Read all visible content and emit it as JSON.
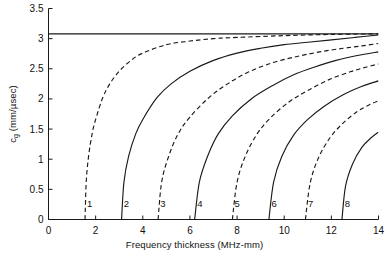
{
  "chart_data": {
    "type": "line",
    "title": "",
    "xlabel": "Frequency thickness (MHz-mm)",
    "ylabel_main": "c",
    "ylabel_sub": "g",
    "ylabel_units": " (mm/µsec)",
    "xlim": [
      0,
      14
    ],
    "ylim": [
      0,
      3.5
    ],
    "xticks": [
      0,
      2,
      4,
      6,
      8,
      10,
      12,
      14
    ],
    "xticklabels": [
      "0",
      "2",
      "4",
      "6",
      "8",
      "10",
      "12",
      "14"
    ],
    "yticks": [
      0,
      0.5,
      1,
      1.5,
      2,
      2.5,
      3,
      3.5
    ],
    "yticklabels": [
      "0",
      "0.5",
      "1",
      "1.5",
      "2",
      "2.5",
      "3",
      "3.5"
    ],
    "grid": false,
    "legend": "none",
    "line_color": "#1a1a1a",
    "series": [
      {
        "name": "asymptote",
        "label": "",
        "style": "solid",
        "cutoff": 0,
        "asymptote": 3.08,
        "x": [
          0,
          1,
          2,
          3,
          4,
          5,
          6,
          7,
          8,
          9,
          10,
          11,
          12,
          13,
          14
        ],
        "values": [
          3.08,
          3.08,
          3.08,
          3.08,
          3.08,
          3.08,
          3.08,
          3.08,
          3.08,
          3.08,
          3.08,
          3.08,
          3.08,
          3.08,
          3.08
        ]
      },
      {
        "name": "mode-1",
        "label": "1",
        "style": "dashed",
        "cutoff": 1.55,
        "asymptote": 3.08,
        "x": [
          1.55,
          1.6,
          1.7,
          1.85,
          2.0,
          2.3,
          2.6,
          3.0,
          3.5,
          4.0,
          5.0,
          6.0,
          7.0,
          8.0,
          10.0,
          12.0,
          14.0
        ],
        "values": [
          0.0,
          0.62,
          1.05,
          1.42,
          1.66,
          2.02,
          2.25,
          2.46,
          2.64,
          2.76,
          2.9,
          2.96,
          3.0,
          3.02,
          3.05,
          3.07,
          3.08
        ]
      },
      {
        "name": "mode-2",
        "label": "2",
        "style": "solid",
        "cutoff": 3.1,
        "asymptote": 3.06,
        "x": [
          3.1,
          3.2,
          3.4,
          3.7,
          4.0,
          4.6,
          5.2,
          6.0,
          7.0,
          8.0,
          9.0,
          10.0,
          11.0,
          12.0,
          13.0,
          14.0
        ],
        "values": [
          0.0,
          0.62,
          1.05,
          1.42,
          1.66,
          2.02,
          2.25,
          2.46,
          2.64,
          2.76,
          2.84,
          2.9,
          2.94,
          2.98,
          3.02,
          3.06
        ]
      },
      {
        "name": "mode-3",
        "label": "3",
        "style": "dashed",
        "cutoff": 4.65,
        "asymptote": 2.92,
        "x": [
          4.65,
          4.8,
          5.1,
          5.5,
          6.0,
          6.8,
          7.6,
          8.5,
          9.5,
          10.5,
          11.5,
          12.5,
          13.3,
          14.0
        ],
        "values": [
          0.0,
          0.62,
          1.05,
          1.42,
          1.7,
          2.02,
          2.25,
          2.45,
          2.6,
          2.7,
          2.78,
          2.84,
          2.88,
          2.92
        ]
      },
      {
        "name": "mode-4",
        "label": "4",
        "style": "solid",
        "cutoff": 6.2,
        "asymptote": 2.78,
        "x": [
          6.2,
          6.4,
          6.75,
          7.2,
          7.8,
          8.6,
          9.5,
          10.4,
          11.3,
          12.2,
          13.1,
          14.0
        ],
        "values": [
          0.0,
          0.62,
          1.05,
          1.42,
          1.72,
          2.0,
          2.22,
          2.4,
          2.53,
          2.64,
          2.72,
          2.78
        ]
      },
      {
        "name": "mode-5",
        "label": "5",
        "style": "dashed",
        "cutoff": 7.8,
        "asymptote": 2.58,
        "x": [
          7.8,
          8.0,
          8.35,
          8.85,
          9.4,
          10.2,
          11.0,
          11.9,
          12.8,
          13.5,
          14.0
        ],
        "values": [
          0.0,
          0.62,
          1.05,
          1.42,
          1.68,
          1.95,
          2.14,
          2.32,
          2.45,
          2.53,
          2.58
        ]
      },
      {
        "name": "mode-6",
        "label": "6",
        "style": "solid",
        "cutoff": 9.35,
        "asymptote": 2.3,
        "x": [
          9.35,
          9.55,
          9.9,
          10.4,
          11.0,
          11.7,
          12.5,
          13.3,
          14.0
        ],
        "values": [
          0.0,
          0.62,
          1.05,
          1.4,
          1.66,
          1.88,
          2.07,
          2.21,
          2.3
        ]
      },
      {
        "name": "mode-7",
        "label": "7",
        "style": "dashed",
        "cutoff": 10.9,
        "asymptote": 1.97,
        "x": [
          10.9,
          11.1,
          11.45,
          11.95,
          12.5,
          13.1,
          13.6,
          14.0
        ],
        "values": [
          0.0,
          0.6,
          1.02,
          1.36,
          1.6,
          1.79,
          1.9,
          1.97
        ]
      },
      {
        "name": "mode-8",
        "label": "8",
        "style": "solid",
        "cutoff": 12.45,
        "asymptote": 1.45,
        "x": [
          12.45,
          12.6,
          12.9,
          13.3,
          13.7,
          14.0
        ],
        "values": [
          0.0,
          0.55,
          0.92,
          1.2,
          1.36,
          1.45
        ]
      }
    ],
    "curve_labels": [
      {
        "text": "1",
        "x": 1.75,
        "y": 0.28
      },
      {
        "text": "2",
        "x": 3.3,
        "y": 0.28
      },
      {
        "text": "3",
        "x": 4.85,
        "y": 0.28
      },
      {
        "text": "4",
        "x": 6.42,
        "y": 0.28
      },
      {
        "text": "5",
        "x": 8.0,
        "y": 0.28
      },
      {
        "text": "6",
        "x": 9.57,
        "y": 0.28
      },
      {
        "text": "7",
        "x": 11.12,
        "y": 0.28
      },
      {
        "text": "8",
        "x": 12.68,
        "y": 0.28
      }
    ]
  }
}
